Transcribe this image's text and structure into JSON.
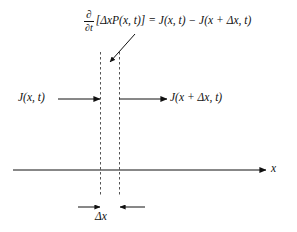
{
  "figure": {
    "name": "probability-flux-balance-diagram",
    "background_color": "#ffffff",
    "line_color": "#1a1a1a",
    "dash_color": "#555555"
  },
  "equation": {
    "derivative_numerator": "∂",
    "derivative_denominator": "∂t",
    "body": "[ΔxP(x, t)] = J(x, t) − J(x + Δx, t)",
    "full_text": "∂/∂t [ΔxP(x, t)] = J(x, t) − J(x + Δx, t)"
  },
  "labels": {
    "flux_in": "J(x, t)",
    "flux_out": "J(x + Δx, t)",
    "axis": "x",
    "cell_width": "Δx"
  },
  "geometry": {
    "axis_y": 170,
    "axis_x_start": 13,
    "axis_x_end": 266,
    "cell_left_x": 100,
    "cell_right_x": 119,
    "dash_top_y": 52,
    "dash_bottom_y": 196,
    "flux_arrow_y": 99,
    "measure_arrow_y": 207
  }
}
